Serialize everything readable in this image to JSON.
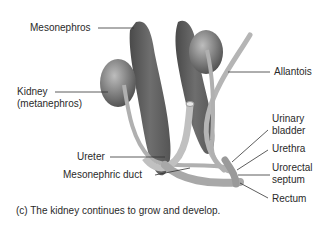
{
  "figure": {
    "labels": {
      "mesonephros": "Mesonephros",
      "kidney_line1": "Kidney",
      "kidney_line2": "(metanephros)",
      "allantois": "Allantois",
      "urinary_bladder_line1": "Urinary",
      "urinary_bladder_line2": "bladder",
      "urethra": "Urethra",
      "urorectal_septum_line1": "Urorectal",
      "urorectal_septum_line2": "septum",
      "rectum": "Rectum",
      "ureter": "Ureter",
      "mesonephric_duct": "Mesonephric duct"
    },
    "caption": "(c) The kidney continues to grow and develop."
  }
}
